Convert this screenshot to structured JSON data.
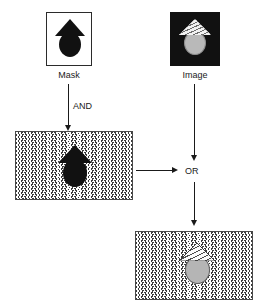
{
  "diagram": {
    "nodes": {
      "mask": {
        "caption": "Mask",
        "kind": "black-silhouette-on-white",
        "glyph": "house-arrow-shape"
      },
      "image": {
        "caption": "Image",
        "kind": "striped-roof-gray-circle-on-black",
        "glyph": "house-shape"
      },
      "and_result": {
        "caption": "",
        "kind": "black-silhouette-on-zigzag",
        "glyph": "house-arrow-shape"
      },
      "or_result": {
        "caption": "",
        "kind": "striped-roof-gray-circle-on-zigzag",
        "glyph": "house-shape"
      }
    },
    "operators": {
      "and": "AND",
      "or": "OR"
    },
    "colors": {
      "ink": "#1a1a1a",
      "black_fill": "#111111",
      "gray_circle": "#b5b5b5",
      "pattern_stroke": "#3a3a3a",
      "panel_border": "#2b2b2b",
      "background": "#ffffff"
    },
    "edges": [
      {
        "name": "mask-to-and-result",
        "from": "mask",
        "to": "and_result",
        "label": "AND",
        "direction": "down"
      },
      {
        "name": "image-to-or",
        "from": "image",
        "to": "or",
        "label": "",
        "direction": "down"
      },
      {
        "name": "and-result-to-or",
        "from": "and_result",
        "to": "or",
        "label": "",
        "direction": "right"
      },
      {
        "name": "or-to-or-result",
        "from": "or",
        "to": "or_result",
        "label": "",
        "direction": "down"
      }
    ]
  }
}
